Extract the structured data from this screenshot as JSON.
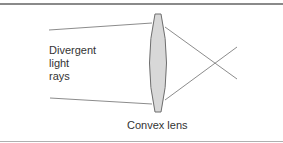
{
  "diagram": {
    "labels": {
      "rays_line1": "Divergent",
      "rays_line2": "light",
      "rays_line3": "rays",
      "lens": "Convex lens"
    },
    "colors": {
      "ray": "#8c8c8c",
      "lens_fill": "#d8d8d8",
      "lens_stroke": "#6e6e6e",
      "rule": "#8a8a8a"
    }
  }
}
